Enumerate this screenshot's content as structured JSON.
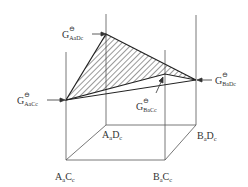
{
  "diagram": {
    "type": "ternary-reciprocal-system free energy surface",
    "corner_labels": {
      "front_left": {
        "main1": "A",
        "sub1": "a",
        "main2": "C",
        "sub2": "c"
      },
      "back_left": {
        "main1": "A",
        "sub1": "a",
        "main2": "D",
        "sub2": "c"
      },
      "front_right": {
        "main1": "B",
        "sub1": "a",
        "main2": "C",
        "sub2": "c"
      },
      "back_right": {
        "main1": "B",
        "sub1": "a",
        "main2": "D",
        "sub2": "c"
      }
    },
    "energy_labels": {
      "AD": {
        "symbol": "G",
        "sup": "⊖",
        "sub": "AₐDᴄ"
      },
      "AC": {
        "symbol": "G",
        "sup": "⊖",
        "sub": "AₐCᴄ"
      },
      "BD": {
        "symbol": "G",
        "sup": "⊖",
        "sub": "BₐDᴄ"
      },
      "BC": {
        "symbol": "G",
        "sup": "⊖",
        "sub": "BₐCᴄ"
      }
    },
    "label_text": {
      "AD_sub": "AaDc",
      "AC_sub": "AaCc",
      "BD_sub": "BaDc",
      "BC_sub": "BaCc"
    },
    "colors": {
      "line": "#444444",
      "hatch": "#333333",
      "background": "#ffffff"
    }
  }
}
